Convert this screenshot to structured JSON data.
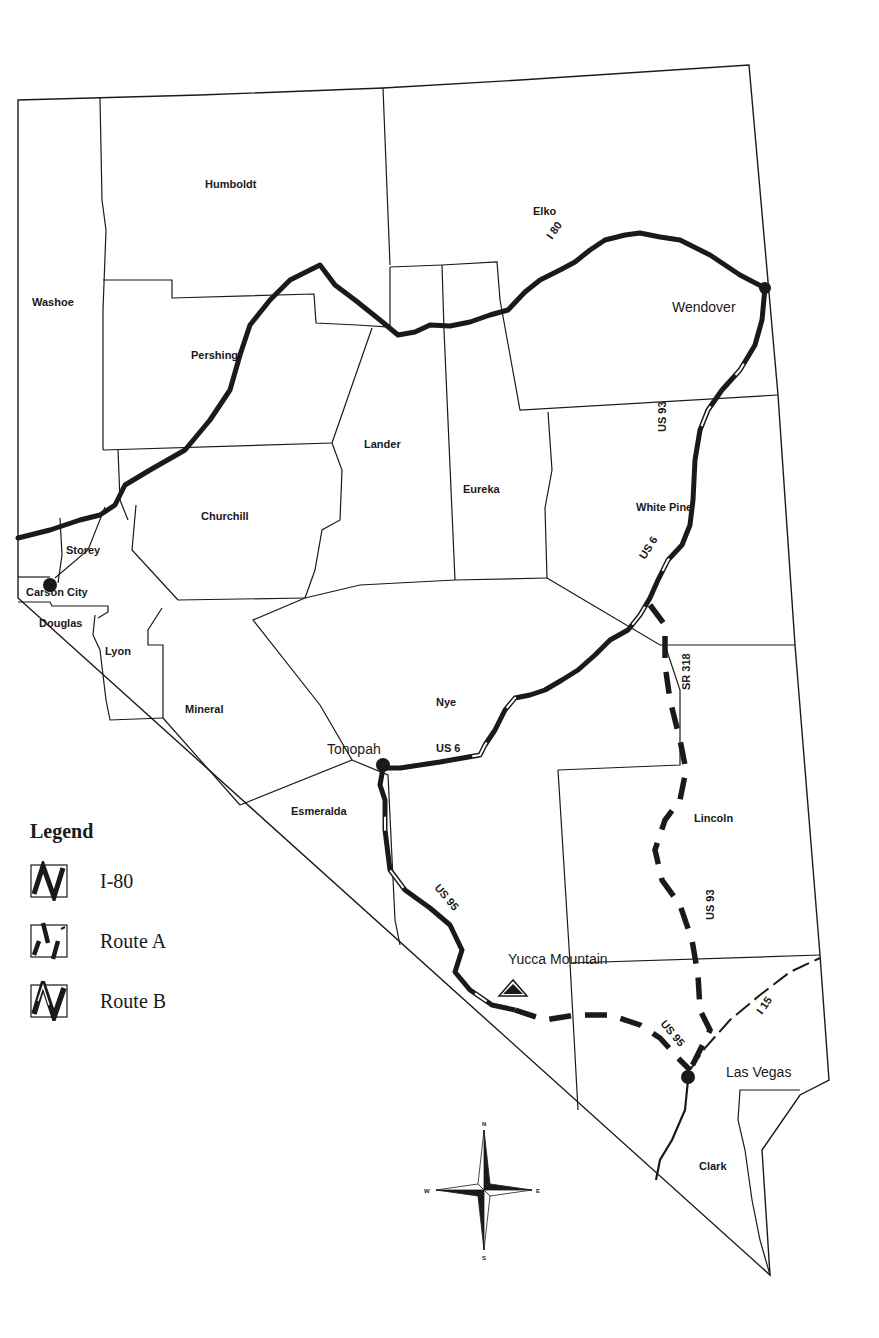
{
  "map": {
    "counties": [
      {
        "name": "Humboldt",
        "x": 205,
        "y": 188
      },
      {
        "name": "Elko",
        "x": 533,
        "y": 215
      },
      {
        "name": "Washoe",
        "x": 32,
        "y": 306
      },
      {
        "name": "Pershing",
        "x": 191,
        "y": 359
      },
      {
        "name": "Lander",
        "x": 364,
        "y": 448
      },
      {
        "name": "Eureka",
        "x": 463,
        "y": 493
      },
      {
        "name": "White Pine",
        "x": 636,
        "y": 511
      },
      {
        "name": "Churchill",
        "x": 201,
        "y": 520
      },
      {
        "name": "Storey",
        "x": 66,
        "y": 554
      },
      {
        "name": "Carson City",
        "x": 26,
        "y": 596
      },
      {
        "name": "Douglas",
        "x": 39,
        "y": 627
      },
      {
        "name": "Lyon",
        "x": 105,
        "y": 655
      },
      {
        "name": "Mineral",
        "x": 185,
        "y": 713
      },
      {
        "name": "Nye",
        "x": 436,
        "y": 706
      },
      {
        "name": "Esmeralda",
        "x": 291,
        "y": 815
      },
      {
        "name": "Lincoln",
        "x": 694,
        "y": 822
      },
      {
        "name": "Clark",
        "x": 699,
        "y": 1170
      }
    ],
    "cities": [
      {
        "name": "Wendover",
        "x": 672,
        "y": 312
      },
      {
        "name": "Tonopah",
        "x": 327,
        "y": 754
      },
      {
        "name": "Yucca Mountain",
        "x": 508,
        "y": 964
      },
      {
        "name": "Las Vegas",
        "x": 726,
        "y": 1077
      }
    ],
    "road_labels": [
      {
        "text": "I 80",
        "x": 552,
        "y": 240,
        "rotate": -55
      },
      {
        "text": "US 93",
        "x": 666,
        "y": 432,
        "rotate": -90
      },
      {
        "text": "US 6",
        "x": 645,
        "y": 560,
        "rotate": -58
      },
      {
        "text": "SR 318",
        "x": 690,
        "y": 690,
        "rotate": -90
      },
      {
        "text": "US 6",
        "x": 436,
        "y": 752,
        "rotate": 0
      },
      {
        "text": "US 95",
        "x": 434,
        "y": 888,
        "rotate": 50
      },
      {
        "text": "US 93",
        "x": 714,
        "y": 920,
        "rotate": -90
      },
      {
        "text": "US 95",
        "x": 660,
        "y": 1024,
        "rotate": 50
      },
      {
        "text": "I 15",
        "x": 762,
        "y": 1015,
        "rotate": -55
      }
    ],
    "compass": {
      "n": "N",
      "s": "S",
      "e": "E",
      "w": "W"
    }
  },
  "legend": {
    "title": "Legend",
    "items": [
      {
        "label": "I-80",
        "style": "solid-thick"
      },
      {
        "label": "Route A",
        "style": "dashed"
      },
      {
        "label": "Route B",
        "style": "cased"
      }
    ]
  },
  "colors": {
    "ink": "#1a1a1a",
    "background": "#ffffff"
  }
}
